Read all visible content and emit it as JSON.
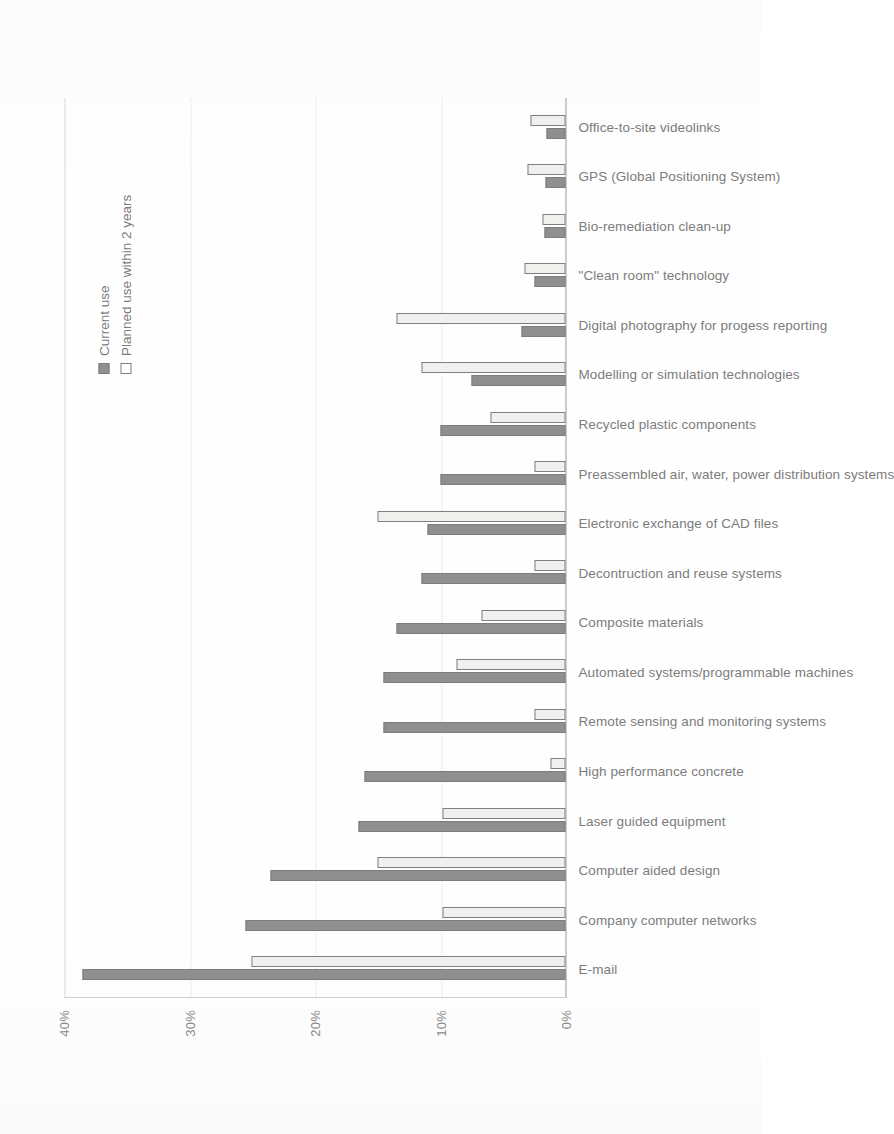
{
  "chart_data": {
    "type": "bar",
    "title": "",
    "xlabel": "",
    "ylabel": "",
    "orientation": "rotated-90",
    "ylim": [
      0,
      40
    ],
    "yticks": [
      0,
      10,
      20,
      30,
      40
    ],
    "ytick_labels": [
      "0%",
      "10%",
      "20%",
      "30%",
      "40%"
    ],
    "grid": true,
    "legend_position": "right",
    "categories": [
      "E-mail",
      "Company computer networks",
      "Computer aided design",
      "Laser guided equipment",
      "High performance concrete",
      "Remote sensing and monitoring systems",
      "Automated systems/programmable machines",
      "Composite materials",
      "Decontruction and reuse systems",
      "Electronic exchange of CAD files",
      "Preassembled air, water, power distribution systems",
      "Recycled plastic components",
      "Modelling or simulation technologies",
      "Digital photography for progess reporting",
      "\"Clean room\" technology",
      "Bio-remediation clean-up",
      "GPS (Global Positioning System)",
      "Office-to-site videolinks"
    ],
    "series": [
      {
        "name": "Current use",
        "color": "#8f8f8f",
        "values": [
          38.5,
          25.5,
          23.5,
          16.5,
          16.0,
          14.5,
          14.5,
          13.5,
          11.5,
          11.0,
          10.0,
          10.0,
          7.5,
          3.5,
          2.5,
          1.7,
          1.6,
          1.5
        ]
      },
      {
        "name": "Planned use within 2 years",
        "color": "#f0f0ee",
        "values": [
          25.0,
          9.8,
          15.0,
          9.8,
          1.2,
          2.5,
          8.7,
          6.7,
          2.5,
          15.0,
          2.5,
          6.0,
          11.5,
          13.5,
          3.3,
          1.8,
          3.0,
          2.8
        ]
      }
    ]
  },
  "legend": {
    "items": [
      {
        "label": "Current use",
        "style": "filled"
      },
      {
        "label": "Planned use within 2 years",
        "style": "outline"
      }
    ]
  },
  "colors": {
    "current_use": "#8f8f8f",
    "planned_use": "#f0f0ee",
    "axis": "#9a9a9a",
    "grid": "#dddddd",
    "text": "#7c7c7c"
  }
}
